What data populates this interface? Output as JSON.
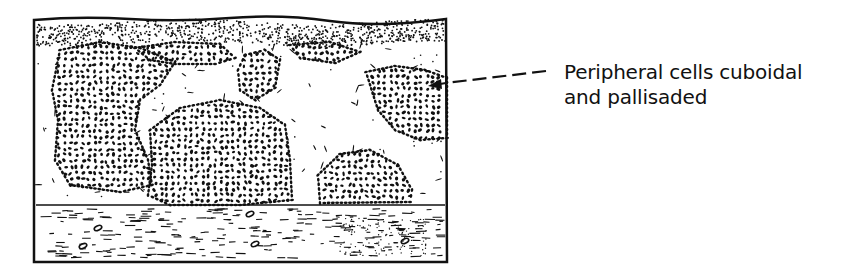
{
  "figure": {
    "type": "histology-diagram",
    "annotation": {
      "lines": [
        "Peripheral cells cuboidal",
        "and pallisaded"
      ],
      "pointer": "dashed-arrow",
      "target": "top-right-cell-nest"
    },
    "regions": [
      "epidermis-surface-dotted-layer",
      "dermis-with-cell-nests",
      "fibrous-stroma-lower-band"
    ],
    "colors": {
      "ink": "#111111",
      "background": "#ffffff"
    }
  }
}
